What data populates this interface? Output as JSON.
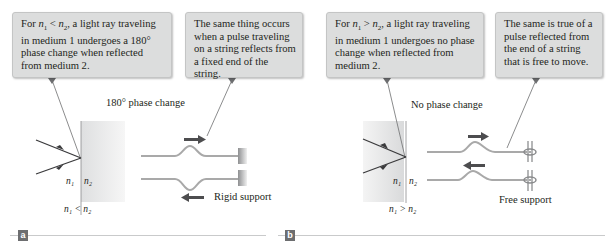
{
  "panels": [
    {
      "id": "a",
      "tag": "a",
      "callout_light": {
        "prefix": "For ",
        "n1": "n",
        "n1_sub": "1",
        "relation": " < ",
        "n2": "n",
        "n2_sub": "2",
        "text": ", a light ray traveling in medium 1 undergoes a 180° phase change when reflected from medium 2."
      },
      "callout_string": "The same thing occurs when a pulse traveling on a string reflects from a fixed end of the string.",
      "phase_label": "180° phase change",
      "interface_left": "n₁",
      "interface_right": "n₂",
      "condition": "n₁ < n₂",
      "support_label": "Rigid support"
    },
    {
      "id": "b",
      "tag": "b",
      "callout_light": {
        "prefix": "For ",
        "n1": "n",
        "n1_sub": "1",
        "relation": " > ",
        "n2": "n",
        "n2_sub": "2",
        "text": ", a light ray traveling in medium 1 undergoes no phase change when reflected from medium 2."
      },
      "callout_string": "The same is true of a pulse reflected from the end of a string that is free to move.",
      "phase_label": "No phase change",
      "interface_left": "n₁",
      "interface_right": "n₂",
      "condition": "n₁ > n₂",
      "support_label": "Free support"
    }
  ],
  "colors": {
    "callout_bg": "#dcdddd",
    "string": "#a9a9a9",
    "arrow": "#4d4d4f",
    "ray": "#3a3a3c",
    "medium": "#e2e3e4",
    "tag_bg": "#6d6e70"
  }
}
